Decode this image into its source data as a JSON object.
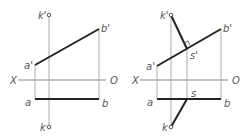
{
  "figures": [
    {
      "name": "left-projection",
      "labels": {
        "k_top": "k'",
        "k_bottom": "k",
        "a_prime": "a'",
        "b_prime": "b'",
        "a": "a",
        "b": "b",
        "x_axis": "X",
        "o_axis": "O"
      }
    },
    {
      "name": "right-projection",
      "labels": {
        "k_top": "k'",
        "k_bottom": "k",
        "a_prime": "a'",
        "b_prime": "b'",
        "a": "a",
        "b": "b",
        "s_prime": "s'",
        "s": "s",
        "x_axis": "X",
        "o_axis": "O"
      }
    }
  ],
  "colors": {
    "line": "#222222",
    "thin": "#aaaaaa",
    "text": "#555555"
  }
}
